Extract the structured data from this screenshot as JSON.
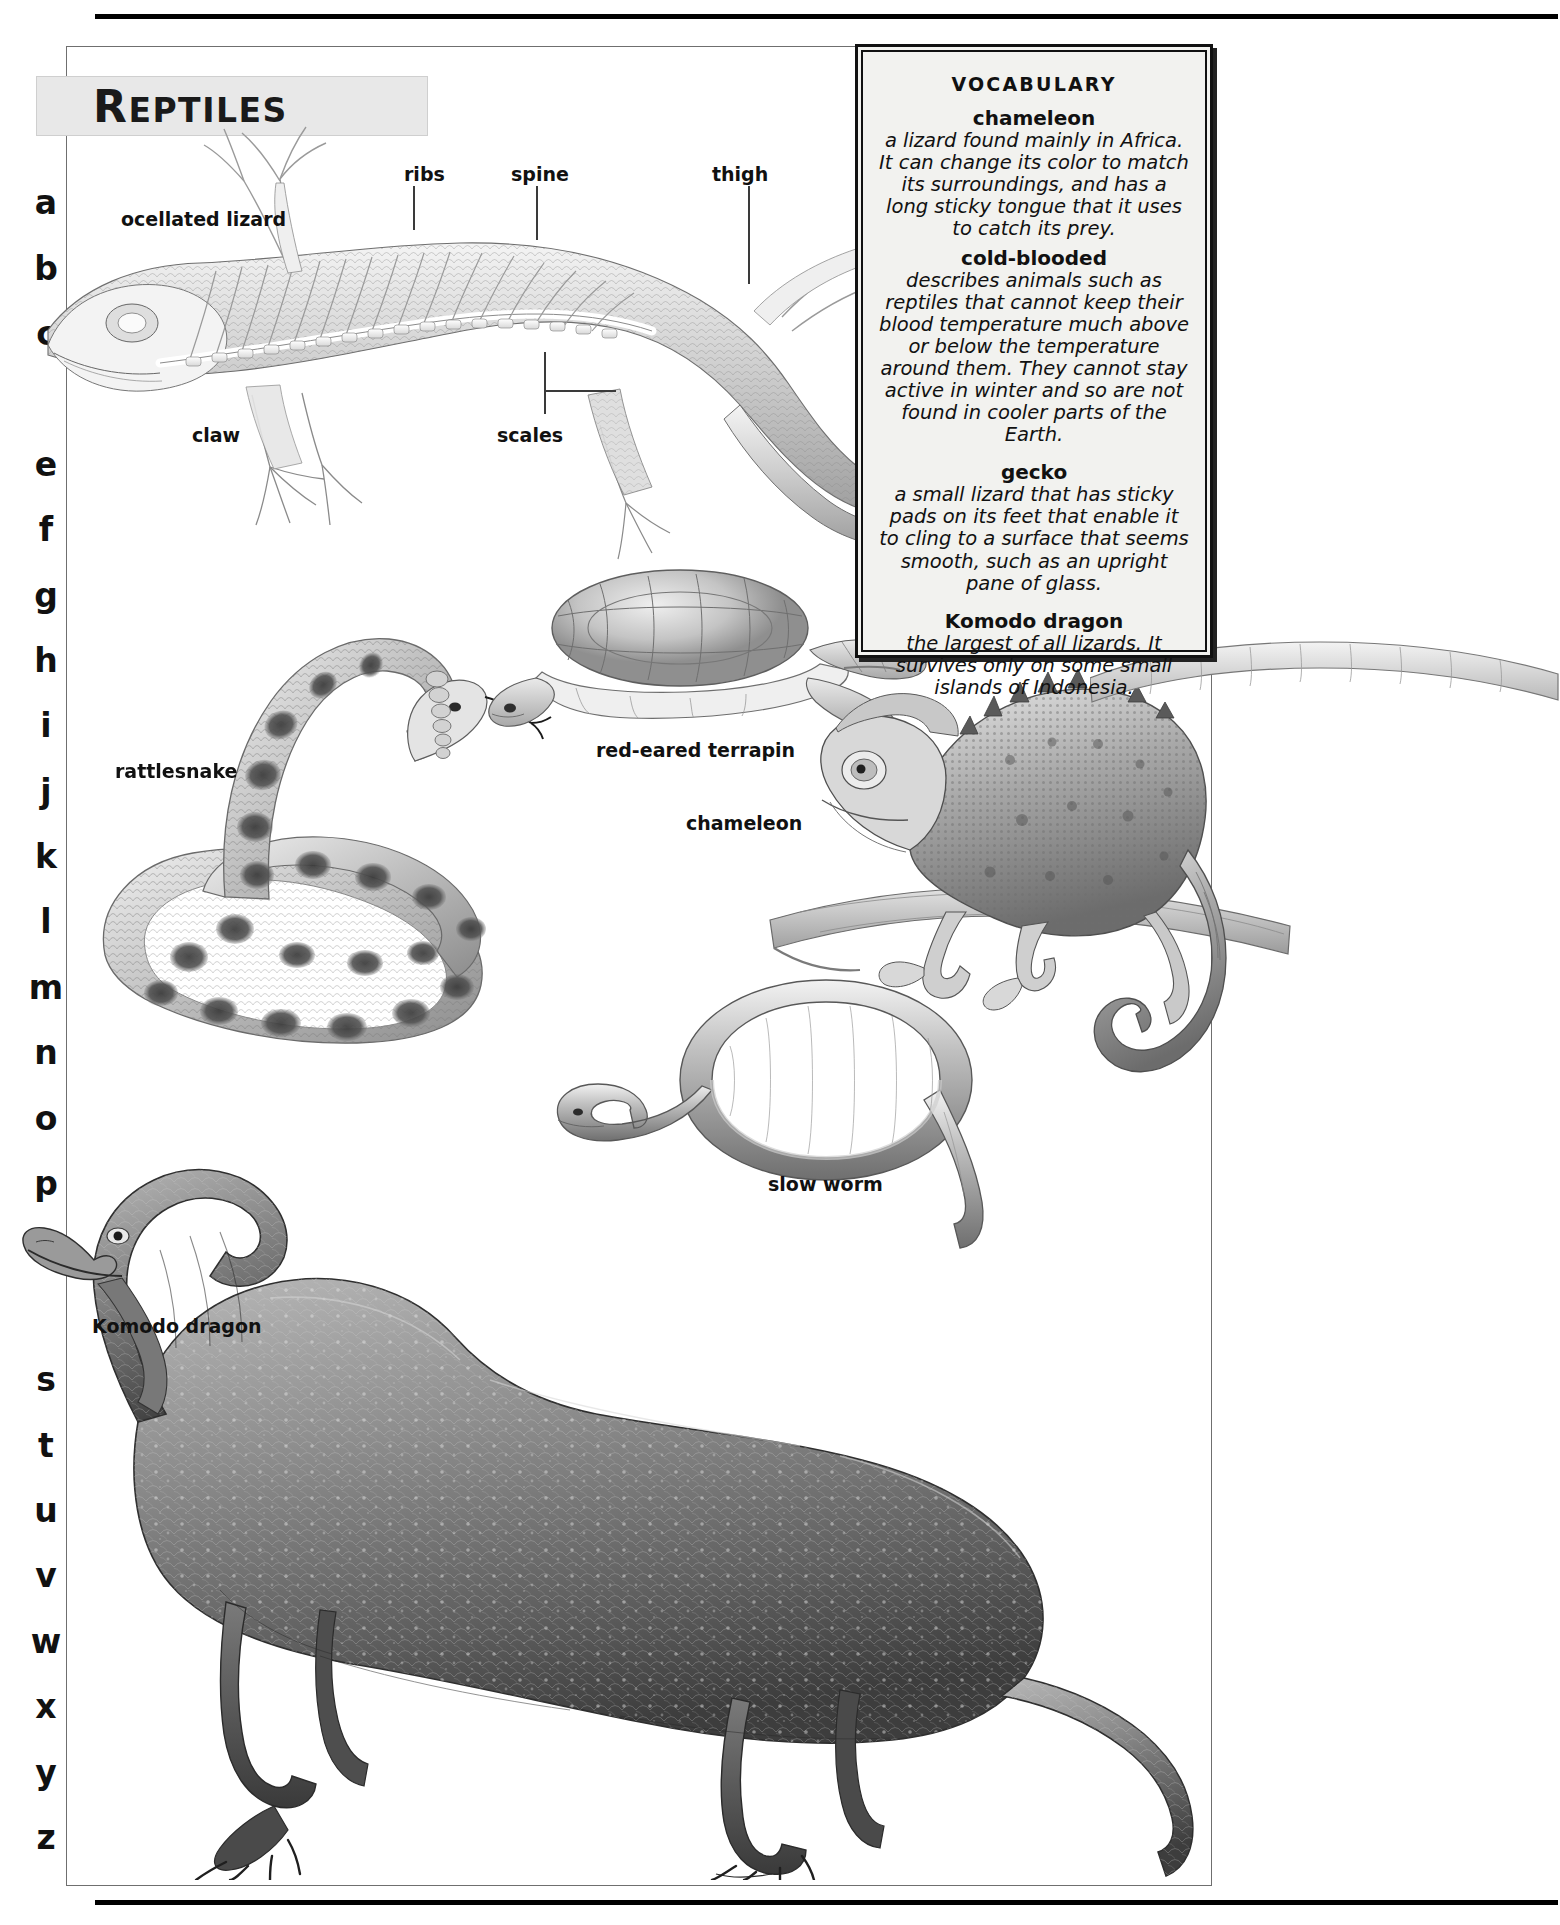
{
  "page": {
    "title": "REPTILES",
    "title_first_letter": "R",
    "title_rest": "EPTILES"
  },
  "alphabet_index": {
    "letters": [
      "a",
      "b",
      "c",
      "d",
      "e",
      "f",
      "g",
      "h",
      "i",
      "j",
      "k",
      "l",
      "m",
      "n",
      "o",
      "p",
      "q",
      "r",
      "s",
      "t",
      "u",
      "v",
      "w",
      "x",
      "y",
      "z"
    ],
    "occluded": [
      "d",
      "r"
    ]
  },
  "vocabulary": {
    "heading": "VOCABULARY",
    "entries": [
      {
        "term": "chameleon",
        "definition": "a lizard found mainly in Africa. It can change its color to match its surroundings, and has a long sticky tongue that it uses to catch its prey."
      },
      {
        "term": "cold-blooded",
        "definition": "describes animals such as reptiles that cannot keep their blood temperature much above or below the temperature around them. They cannot stay active in winter and so are not found in cooler parts of the Earth."
      },
      {
        "term": "gecko",
        "definition": "a small lizard that has sticky pads on its feet that enable it to cling to a surface that seems smooth, such as an upright pane of glass."
      },
      {
        "term": "Komodo dragon",
        "definition": "the largest of all lizards. It survives only on some small islands of Indonesia."
      }
    ]
  },
  "anatomy_labels": {
    "ribs": "ribs",
    "spine": "spine",
    "thigh": "thigh",
    "claw": "claw",
    "scales": "scales"
  },
  "specimen_labels": {
    "ocellated_lizard": "ocellated lizard",
    "rattlesnake": "rattlesnake",
    "red_eared_terrapin": "red-eared terrapin",
    "chameleon": "chameleon",
    "slow_worm": "slow worm",
    "komodo_dragon": "Komodo dragon"
  },
  "colors": {
    "ink": "#111111",
    "plaque": "#e8e8e8",
    "vocab_bg": "#f2f2ef",
    "frame": "#6f6f6f"
  }
}
